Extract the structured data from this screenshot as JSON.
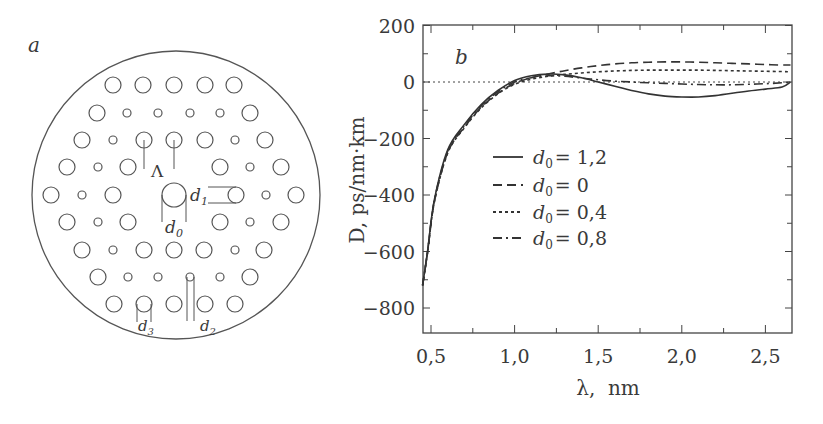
{
  "panel_a": {
    "label": "a",
    "outer_circle": {
      "cx": 176,
      "cy": 195,
      "r": 144
    },
    "holes": [
      {
        "cx": 113,
        "cy": 85,
        "r": 8
      },
      {
        "cx": 143,
        "cy": 85,
        "r": 8
      },
      {
        "cx": 174,
        "cy": 85,
        "r": 8
      },
      {
        "cx": 205,
        "cy": 85,
        "r": 8
      },
      {
        "cx": 234,
        "cy": 85,
        "r": 8
      },
      {
        "cx": 97,
        "cy": 113,
        "r": 8
      },
      {
        "cx": 127,
        "cy": 113,
        "r": 4
      },
      {
        "cx": 158,
        "cy": 113,
        "r": 4
      },
      {
        "cx": 190,
        "cy": 113,
        "r": 4
      },
      {
        "cx": 220,
        "cy": 113,
        "r": 4
      },
      {
        "cx": 250,
        "cy": 113,
        "r": 8
      },
      {
        "cx": 82,
        "cy": 140,
        "r": 8
      },
      {
        "cx": 113,
        "cy": 140,
        "r": 4
      },
      {
        "cx": 144,
        "cy": 140,
        "r": 8
      },
      {
        "cx": 174,
        "cy": 140,
        "r": 8
      },
      {
        "cx": 205,
        "cy": 140,
        "r": 8
      },
      {
        "cx": 235,
        "cy": 140,
        "r": 4
      },
      {
        "cx": 265,
        "cy": 140,
        "r": 8
      },
      {
        "cx": 67,
        "cy": 167,
        "r": 8
      },
      {
        "cx": 98,
        "cy": 167,
        "r": 4
      },
      {
        "cx": 128,
        "cy": 167,
        "r": 8
      },
      {
        "cx": 220,
        "cy": 167,
        "r": 8
      },
      {
        "cx": 250,
        "cy": 167,
        "r": 4
      },
      {
        "cx": 281,
        "cy": 167,
        "r": 8
      },
      {
        "cx": 51,
        "cy": 195,
        "r": 8
      },
      {
        "cx": 82,
        "cy": 195,
        "r": 4
      },
      {
        "cx": 113,
        "cy": 195,
        "r": 8
      },
      {
        "cx": 174,
        "cy": 195,
        "r": 12
      },
      {
        "cx": 236,
        "cy": 195,
        "r": 8
      },
      {
        "cx": 266,
        "cy": 195,
        "r": 4
      },
      {
        "cx": 296,
        "cy": 195,
        "r": 8
      },
      {
        "cx": 67,
        "cy": 222,
        "r": 8
      },
      {
        "cx": 98,
        "cy": 222,
        "r": 4
      },
      {
        "cx": 128,
        "cy": 222,
        "r": 8
      },
      {
        "cx": 220,
        "cy": 222,
        "r": 8
      },
      {
        "cx": 250,
        "cy": 222,
        "r": 4
      },
      {
        "cx": 281,
        "cy": 222,
        "r": 8
      },
      {
        "cx": 82,
        "cy": 250,
        "r": 8
      },
      {
        "cx": 113,
        "cy": 250,
        "r": 4
      },
      {
        "cx": 144,
        "cy": 250,
        "r": 8
      },
      {
        "cx": 174,
        "cy": 250,
        "r": 8
      },
      {
        "cx": 204,
        "cy": 250,
        "r": 8
      },
      {
        "cx": 235,
        "cy": 250,
        "r": 4
      },
      {
        "cx": 264,
        "cy": 250,
        "r": 8
      },
      {
        "cx": 98,
        "cy": 277,
        "r": 8
      },
      {
        "cx": 128,
        "cy": 277,
        "r": 4
      },
      {
        "cx": 158,
        "cy": 277,
        "r": 4
      },
      {
        "cx": 190,
        "cy": 277,
        "r": 4
      },
      {
        "cx": 220,
        "cy": 277,
        "r": 4
      },
      {
        "cx": 250,
        "cy": 277,
        "r": 8
      },
      {
        "cx": 114,
        "cy": 304,
        "r": 8
      },
      {
        "cx": 144,
        "cy": 304,
        "r": 8
      },
      {
        "cx": 174,
        "cy": 304,
        "r": 8
      },
      {
        "cx": 205,
        "cy": 304,
        "r": 8
      },
      {
        "cx": 235,
        "cy": 304,
        "r": 8
      }
    ],
    "annotations": {
      "lambda": "Λ",
      "d0_base": "d",
      "d0_sub": "0",
      "d1_base": "d",
      "d1_sub": "1",
      "d2_base": "d",
      "d2_sub": "2",
      "d3_base": "d",
      "d3_sub": "3"
    }
  },
  "chart_data": {
    "type": "line",
    "panel_label": "b",
    "title": "",
    "xlabel": "λ,  nm",
    "ylabel": "D,  ps/nm·km",
    "xlim": [
      0.45,
      2.65
    ],
    "ylim": [
      -880,
      200
    ],
    "x_ticks": [
      0.5,
      1.0,
      1.5,
      2.0,
      2.5
    ],
    "x_tick_labels": [
      "0,5",
      "1,0",
      "1,5",
      "2,0",
      "2,5"
    ],
    "y_ticks": [
      200,
      0,
      -200,
      -400,
      -600,
      -800
    ],
    "y_tick_labels": [
      "200",
      "0",
      "−200",
      "−400",
      "−600",
      "−800"
    ],
    "grid": false,
    "reference_line": {
      "y": 0,
      "style": "dotted"
    },
    "legend_position": "center-left inside plot",
    "series": [
      {
        "name": "d0 = 1,2",
        "label_base": "d",
        "label_sub": "0",
        "label_value": "= 1,2",
        "style": "solid",
        "x": [
          0.45,
          0.48,
          0.52,
          0.6,
          0.7,
          0.8,
          0.9,
          1.0,
          1.1,
          1.2,
          1.3,
          1.4,
          1.5,
          1.6,
          1.7,
          1.8,
          1.9,
          2.0,
          2.1,
          2.2,
          2.3,
          2.4,
          2.5,
          2.6,
          2.65
        ],
        "values": [
          -720,
          -595,
          -418,
          -240,
          -150,
          -80,
          -30,
          5,
          22,
          28,
          25,
          15,
          0,
          -15,
          -30,
          -42,
          -50,
          -53,
          -53,
          -48,
          -40,
          -32,
          -25,
          -18,
          0
        ]
      },
      {
        "name": "d0 = 0",
        "label_base": "d",
        "label_sub": "0",
        "label_value": "= 0",
        "style": "dashed",
        "x": [
          0.45,
          0.48,
          0.52,
          0.6,
          0.7,
          0.8,
          0.9,
          1.0,
          1.1,
          1.2,
          1.3,
          1.4,
          1.5,
          1.6,
          1.7,
          1.8,
          1.9,
          2.0,
          2.1,
          2.2,
          2.3,
          2.4,
          2.5,
          2.6,
          2.65
        ],
        "values": [
          -720,
          -600,
          -425,
          -250,
          -160,
          -90,
          -40,
          -5,
          15,
          28,
          40,
          50,
          58,
          64,
          68,
          70,
          71,
          71,
          70,
          68,
          66,
          64,
          62,
          60,
          60
        ]
      },
      {
        "name": "d0 = 0,4",
        "label_base": "d",
        "label_sub": "0",
        "label_value": "= 0,4",
        "style": "dotted",
        "x": [
          0.45,
          0.48,
          0.52,
          0.6,
          0.7,
          0.8,
          0.9,
          1.0,
          1.1,
          1.2,
          1.3,
          1.4,
          1.5,
          1.6,
          1.7,
          1.8,
          1.9,
          2.0,
          2.1,
          2.2,
          2.3,
          2.4,
          2.5,
          2.6,
          2.65
        ],
        "values": [
          -720,
          -600,
          -425,
          -252,
          -162,
          -92,
          -42,
          -8,
          10,
          20,
          27,
          32,
          36,
          39,
          41,
          42,
          42,
          42,
          42,
          41,
          40,
          39,
          38,
          37,
          36
        ]
      },
      {
        "name": "d0 = 0,8",
        "label_base": "d",
        "label_sub": "0",
        "label_value": "= 0,8",
        "style": "dashdot",
        "x": [
          0.45,
          0.48,
          0.52,
          0.6,
          0.7,
          0.8,
          0.9,
          1.0,
          1.1,
          1.2,
          1.3,
          1.4,
          1.5,
          1.6,
          1.7,
          1.8,
          1.9,
          2.0,
          2.1,
          2.2,
          2.3,
          2.4,
          2.5,
          2.6,
          2.65
        ],
        "values": [
          -720,
          -598,
          -420,
          -245,
          -155,
          -85,
          -35,
          0,
          15,
          22,
          20,
          14,
          8,
          3,
          0,
          -3,
          -5,
          -7,
          -9,
          -10,
          -10,
          -8,
          -6,
          -3,
          0
        ]
      }
    ]
  }
}
